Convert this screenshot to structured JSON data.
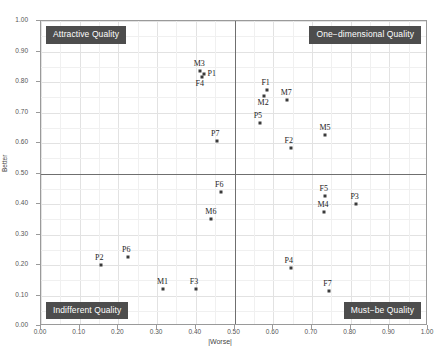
{
  "chart_data": {
    "type": "scatter",
    "title": "",
    "xlabel": "|Worse|",
    "ylabel": "Better",
    "xlim": [
      0.0,
      1.0
    ],
    "ylim": [
      0.0,
      1.0
    ],
    "grid": true,
    "legend": "none",
    "xticks": [
      "0.00",
      "0.10",
      "0.20",
      "0.30",
      "0.40",
      "0.50",
      "0.60",
      "0.70",
      "0.80",
      "0.90",
      "1.00"
    ],
    "yticks": [
      "0.00",
      "0.10",
      "0.20",
      "0.30",
      "0.40",
      "0.50",
      "0.60",
      "0.70",
      "0.80",
      "0.90",
      "1.00"
    ],
    "xtick_values": [
      0.0,
      0.1,
      0.2,
      0.3,
      0.4,
      0.5,
      0.6,
      0.7,
      0.8,
      0.9,
      1.0
    ],
    "ytick_values": [
      0.0,
      0.1,
      0.2,
      0.3,
      0.4,
      0.5,
      0.6,
      0.7,
      0.8,
      0.9,
      1.0
    ],
    "dividers": {
      "x": 0.5,
      "y": 0.5
    },
    "point_color": "#3a3a3a",
    "quadrant_label_bg": "#4d4d4d",
    "quadrants": [
      {
        "name": "attractive",
        "label": "Attractive Quality",
        "corner": "top-left"
      },
      {
        "name": "one-dimensional",
        "label": "One−dimensional Quality",
        "corner": "top-right"
      },
      {
        "name": "indifferent",
        "label": "Indifferent Quality",
        "corner": "bottom-left"
      },
      {
        "name": "must-be",
        "label": "Must−be Quality",
        "corner": "bottom-right"
      }
    ],
    "points": [
      {
        "label": "M3",
        "x": 0.41,
        "y": 0.835,
        "quadrant": "attractive",
        "label_pos": "above"
      },
      {
        "label": "P1",
        "x": 0.42,
        "y": 0.825,
        "quadrant": "attractive",
        "label_pos": "right"
      },
      {
        "label": "F4",
        "x": 0.415,
        "y": 0.815,
        "quadrant": "attractive",
        "label_pos": "below"
      },
      {
        "label": "P7",
        "x": 0.455,
        "y": 0.605,
        "quadrant": "attractive",
        "label_pos": "above"
      },
      {
        "label": "F1",
        "x": 0.585,
        "y": 0.775,
        "quadrant": "one-dimensional",
        "label_pos": "above"
      },
      {
        "label": "M2",
        "x": 0.575,
        "y": 0.755,
        "quadrant": "one-dimensional",
        "label_pos": "below"
      },
      {
        "label": "M7",
        "x": 0.635,
        "y": 0.74,
        "quadrant": "one-dimensional",
        "label_pos": "above"
      },
      {
        "label": "P5",
        "x": 0.565,
        "y": 0.665,
        "quadrant": "one-dimensional",
        "label_pos": "above"
      },
      {
        "label": "M5",
        "x": 0.735,
        "y": 0.625,
        "quadrant": "one-dimensional",
        "label_pos": "above"
      },
      {
        "label": "F2",
        "x": 0.645,
        "y": 0.585,
        "quadrant": "one-dimensional",
        "label_pos": "above"
      },
      {
        "label": "F6",
        "x": 0.465,
        "y": 0.44,
        "quadrant": "indifferent",
        "label_pos": "above"
      },
      {
        "label": "M6",
        "x": 0.44,
        "y": 0.35,
        "quadrant": "indifferent",
        "label_pos": "above"
      },
      {
        "label": "P6",
        "x": 0.225,
        "y": 0.225,
        "quadrant": "indifferent",
        "label_pos": "above"
      },
      {
        "label": "P2",
        "x": 0.155,
        "y": 0.2,
        "quadrant": "indifferent",
        "label_pos": "above"
      },
      {
        "label": "M1",
        "x": 0.315,
        "y": 0.12,
        "quadrant": "indifferent",
        "label_pos": "above"
      },
      {
        "label": "F3",
        "x": 0.4,
        "y": 0.12,
        "quadrant": "indifferent",
        "label_pos": "above"
      },
      {
        "label": "F5",
        "x": 0.735,
        "y": 0.425,
        "quadrant": "must-be",
        "label_pos": "above"
      },
      {
        "label": "P3",
        "x": 0.815,
        "y": 0.4,
        "quadrant": "must-be",
        "label_pos": "above"
      },
      {
        "label": "M4",
        "x": 0.73,
        "y": 0.375,
        "quadrant": "must-be",
        "label_pos": "above"
      },
      {
        "label": "P4",
        "x": 0.645,
        "y": 0.19,
        "quadrant": "must-be",
        "label_pos": "above"
      },
      {
        "label": "F7",
        "x": 0.745,
        "y": 0.115,
        "quadrant": "must-be",
        "label_pos": "above"
      }
    ]
  }
}
